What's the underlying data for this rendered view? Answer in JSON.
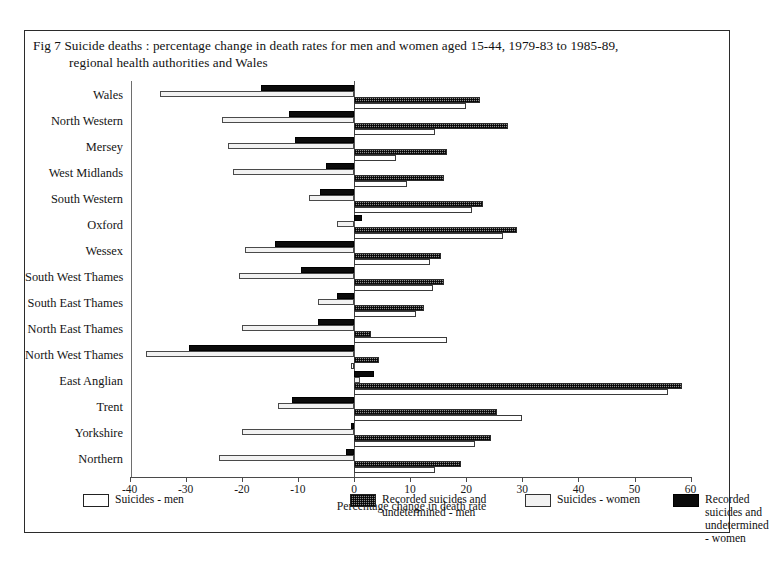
{
  "figure": {
    "number": "Fig 7",
    "title_line1": "Suicide deaths : percentage change in death rates for men and women aged 15-44, 1979-83 to 1985-89,",
    "title_line2": "regional health authorities and Wales"
  },
  "chart_data": {
    "type": "bar",
    "orientation": "horizontal",
    "title": "Fig 7  Suicide deaths : percentage change in death rates for men and women aged 15-44, 1979-83 to 1985-89, regional health authorities and Wales",
    "xlabel": "Percentage change in death rate",
    "ylabel": "",
    "xlim": [
      -40,
      60
    ],
    "xticks": [
      -40,
      -30,
      -20,
      -10,
      0,
      10,
      20,
      30,
      40,
      50,
      60
    ],
    "xticklabels": [
      "-40",
      "-30",
      "-20",
      "-10",
      "0",
      "10",
      "20",
      "30",
      "40",
      "50",
      "60"
    ],
    "grid": false,
    "legend_position": "bottom",
    "categories": [
      "Wales",
      "North Western",
      "Mersey",
      "West Midlands",
      "South Western",
      "Oxford",
      "Wessex",
      "South West Thames",
      "South East Thames",
      "North East Thames",
      "North West Thames",
      "East Anglian",
      "Trent",
      "Yorkshire",
      "Northern"
    ],
    "series": [
      {
        "name": "Recorded suicides and undetermined - women",
        "key": "r-women",
        "values": [
          -16.5,
          -11.5,
          -10.5,
          -5.0,
          -6.0,
          1.5,
          -14.0,
          -9.5,
          -3.0,
          -6.5,
          -29.5,
          3.5,
          -11.0,
          -0.5,
          -1.5
        ]
      },
      {
        "name": "Suicides - women",
        "key": "s-women",
        "values": [
          -34.5,
          -23.5,
          -22.5,
          -21.5,
          -8.0,
          -3.0,
          -19.5,
          -20.5,
          -6.5,
          -20.0,
          -37.0,
          1.0,
          -13.5,
          -20.0,
          -24.0
        ]
      },
      {
        "name": "Recorded suicides and undetermined - men",
        "key": "r-men",
        "values": [
          22.5,
          27.5,
          16.5,
          16.0,
          23.0,
          29.0,
          15.5,
          16.0,
          12.5,
          3.0,
          4.5,
          58.5,
          25.5,
          24.5,
          19.0
        ]
      },
      {
        "name": "Suicides - men",
        "key": "s-men",
        "values": [
          20.0,
          14.5,
          7.5,
          9.5,
          21.0,
          26.5,
          13.5,
          14.0,
          11.0,
          16.5,
          -0.5,
          56.0,
          30.0,
          21.5,
          14.5
        ]
      }
    ]
  },
  "legend": {
    "items": [
      {
        "key": "s-men",
        "label": "Suicides - men"
      },
      {
        "key": "r-men",
        "label": "Recorded suicides and\nundetermined - men"
      },
      {
        "key": "s-women",
        "label": "Suicides - women"
      },
      {
        "key": "r-women",
        "label": "Recorded suicides and\nundetermined - women"
      }
    ]
  }
}
